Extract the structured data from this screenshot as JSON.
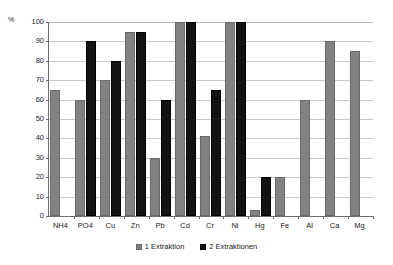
{
  "chart_data": {
    "type": "bar",
    "title": "",
    "xlabel": "",
    "ylabel": "%",
    "ylim": [
      0,
      100
    ],
    "yticks": [
      0,
      10,
      20,
      30,
      40,
      50,
      60,
      70,
      80,
      90,
      100
    ],
    "grid": true,
    "legend_position": "bottom-center",
    "categories": [
      "NH4",
      "PO4",
      "Cu",
      "Zn",
      "Pb",
      "Cd",
      "Cr",
      "Ni",
      "Hg",
      "Fe",
      "Al",
      "Ca",
      "Mg"
    ],
    "series": [
      {
        "name": "1 Extraktion",
        "color": "#828282",
        "values": [
          65,
          60,
          70,
          95,
          30,
          100,
          41,
          100,
          3,
          20,
          60,
          90,
          85
        ]
      },
      {
        "name": "2 Extraktionen",
        "color": "#121212",
        "values": [
          null,
          90,
          80,
          95,
          60,
          100,
          65,
          100,
          20,
          null,
          null,
          null,
          null
        ]
      }
    ]
  },
  "axis": {
    "y_unit_label": "%",
    "y_tick_labels": [
      "0",
      "10",
      "20",
      "30",
      "40",
      "50",
      "60",
      "70",
      "80",
      "90",
      "100"
    ]
  },
  "legend": {
    "items": [
      {
        "label": "1 Extraktion",
        "marker": "square-gray"
      },
      {
        "label": "2 Extraktionen",
        "marker": "square-black"
      }
    ]
  }
}
